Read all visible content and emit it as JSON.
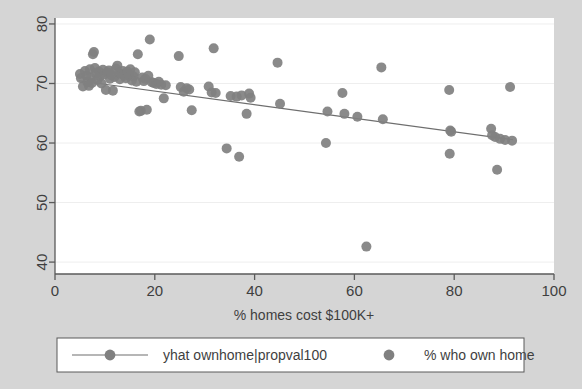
{
  "figure": {
    "background_color": "#d5d5d5",
    "plot_background_color": "#ffffff",
    "marker_color": "#808080",
    "line_color": "#6e6e6e",
    "axis_color": "#5a5a5a",
    "text_color": "#3f3f3f"
  },
  "chart_data": {
    "type": "scatter",
    "title": "",
    "subtitle": "",
    "xlabel": "% homes cost $100K+",
    "ylabel": "",
    "xlim": [
      0,
      100
    ],
    "ylim": [
      38,
      81
    ],
    "xticks": [
      0,
      20,
      40,
      60,
      80,
      100
    ],
    "yticks": [
      40,
      50,
      60,
      70,
      80
    ],
    "xtick_labels": [
      "0",
      "20",
      "40",
      "60",
      "80",
      "100"
    ],
    "ytick_labels": [
      "40",
      "50",
      "60",
      "70",
      "80"
    ],
    "grid": false,
    "legend_position": "bottom",
    "series": [
      {
        "name": "yhat ownhome|propval100",
        "type": "line",
        "marker": "circle",
        "color": "#6e6e6e",
        "points": [
          {
            "x": 4.8,
            "y": 70.45
          },
          {
            "x": 91.8,
            "y": 60.55
          }
        ]
      },
      {
        "name": "% who own home",
        "type": "scatter",
        "marker": "circle",
        "color": "#808080",
        "points": [
          {
            "x": 5.0,
            "y": 71.6
          },
          {
            "x": 5.2,
            "y": 70.9
          },
          {
            "x": 5.6,
            "y": 69.5
          },
          {
            "x": 6.0,
            "y": 72.1
          },
          {
            "x": 6.3,
            "y": 71.3
          },
          {
            "x": 6.5,
            "y": 70.2
          },
          {
            "x": 6.8,
            "y": 69.6
          },
          {
            "x": 7.0,
            "y": 72.4
          },
          {
            "x": 7.2,
            "y": 71.0
          },
          {
            "x": 7.4,
            "y": 70.1
          },
          {
            "x": 7.6,
            "y": 74.9
          },
          {
            "x": 7.8,
            "y": 75.3
          },
          {
            "x": 8.0,
            "y": 72.6
          },
          {
            "x": 8.2,
            "y": 71.7
          },
          {
            "x": 8.5,
            "y": 70.6
          },
          {
            "x": 8.8,
            "y": 72.0
          },
          {
            "x": 9.0,
            "y": 71.2
          },
          {
            "x": 9.3,
            "y": 70.0
          },
          {
            "x": 9.6,
            "y": 72.3
          },
          {
            "x": 9.9,
            "y": 71.5
          },
          {
            "x": 10.2,
            "y": 68.9
          },
          {
            "x": 10.5,
            "y": 71.9
          },
          {
            "x": 10.8,
            "y": 72.2
          },
          {
            "x": 11.0,
            "y": 70.8
          },
          {
            "x": 11.3,
            "y": 71.4
          },
          {
            "x": 11.6,
            "y": 68.8
          },
          {
            "x": 11.9,
            "y": 71.1
          },
          {
            "x": 12.2,
            "y": 72.5
          },
          {
            "x": 12.5,
            "y": 73.0
          },
          {
            "x": 12.8,
            "y": 71.8
          },
          {
            "x": 13.0,
            "y": 70.7
          },
          {
            "x": 13.3,
            "y": 71.6
          },
          {
            "x": 13.6,
            "y": 72.1
          },
          {
            "x": 13.9,
            "y": 71.3
          },
          {
            "x": 14.2,
            "y": 70.9
          },
          {
            "x": 14.5,
            "y": 72.0
          },
          {
            "x": 14.8,
            "y": 71.5
          },
          {
            "x": 15.1,
            "y": 72.4
          },
          {
            "x": 15.4,
            "y": 70.5
          },
          {
            "x": 15.7,
            "y": 71.2
          },
          {
            "x": 16.0,
            "y": 71.9
          },
          {
            "x": 16.3,
            "y": 70.3
          },
          {
            "x": 16.6,
            "y": 74.9
          },
          {
            "x": 16.9,
            "y": 65.3
          },
          {
            "x": 17.2,
            "y": 65.4
          },
          {
            "x": 17.5,
            "y": 71.0
          },
          {
            "x": 17.8,
            "y": 70.4
          },
          {
            "x": 18.1,
            "y": 70.8
          },
          {
            "x": 18.4,
            "y": 65.6
          },
          {
            "x": 18.7,
            "y": 71.3
          },
          {
            "x": 19.0,
            "y": 77.4
          },
          {
            "x": 19.4,
            "y": 70.2
          },
          {
            "x": 19.8,
            "y": 70.1
          },
          {
            "x": 20.3,
            "y": 69.9
          },
          {
            "x": 20.8,
            "y": 70.3
          },
          {
            "x": 21.3,
            "y": 69.8
          },
          {
            "x": 21.8,
            "y": 67.5
          },
          {
            "x": 22.2,
            "y": 69.7
          },
          {
            "x": 24.8,
            "y": 74.6
          },
          {
            "x": 25.2,
            "y": 69.4
          },
          {
            "x": 25.8,
            "y": 68.6
          },
          {
            "x": 26.4,
            "y": 69.2
          },
          {
            "x": 26.9,
            "y": 69.0
          },
          {
            "x": 27.4,
            "y": 65.5
          },
          {
            "x": 30.8,
            "y": 69.5
          },
          {
            "x": 31.4,
            "y": 68.5
          },
          {
            "x": 31.8,
            "y": 75.9
          },
          {
            "x": 32.2,
            "y": 68.4
          },
          {
            "x": 34.4,
            "y": 59.1
          },
          {
            "x": 35.2,
            "y": 67.9
          },
          {
            "x": 36.4,
            "y": 67.8
          },
          {
            "x": 36.9,
            "y": 57.7
          },
          {
            "x": 37.4,
            "y": 68.0
          },
          {
            "x": 38.4,
            "y": 64.9
          },
          {
            "x": 38.9,
            "y": 68.3
          },
          {
            "x": 39.2,
            "y": 67.6
          },
          {
            "x": 44.6,
            "y": 73.5
          },
          {
            "x": 45.1,
            "y": 66.6
          },
          {
            "x": 54.3,
            "y": 60.0
          },
          {
            "x": 54.6,
            "y": 65.3
          },
          {
            "x": 57.6,
            "y": 68.4
          },
          {
            "x": 58.0,
            "y": 64.9
          },
          {
            "x": 60.6,
            "y": 64.4
          },
          {
            "x": 62.4,
            "y": 42.6
          },
          {
            "x": 65.4,
            "y": 72.7
          },
          {
            "x": 65.7,
            "y": 64.0
          },
          {
            "x": 79.0,
            "y": 68.9
          },
          {
            "x": 79.1,
            "y": 58.2
          },
          {
            "x": 79.2,
            "y": 62.1
          },
          {
            "x": 79.4,
            "y": 61.9
          },
          {
            "x": 87.4,
            "y": 62.4
          },
          {
            "x": 87.6,
            "y": 61.3
          },
          {
            "x": 88.2,
            "y": 61.0
          },
          {
            "x": 88.6,
            "y": 55.5
          },
          {
            "x": 89.2,
            "y": 60.7
          },
          {
            "x": 90.2,
            "y": 60.5
          },
          {
            "x": 91.2,
            "y": 69.4
          },
          {
            "x": 91.6,
            "y": 60.4
          }
        ]
      }
    ]
  },
  "legend": {
    "entries": [
      {
        "label": "yhat ownhome|propval100",
        "marker": "line-with-circle"
      },
      {
        "label": "% who own home",
        "marker": "circle"
      }
    ]
  }
}
